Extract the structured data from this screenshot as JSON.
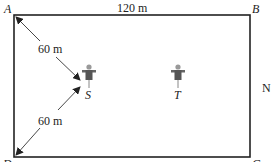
{
  "diagram": {
    "type": "field-layout",
    "corners": {
      "top_left": "A",
      "top_right": "B",
      "bottom_right": "C",
      "bottom_left": "D"
    },
    "dimensions": {
      "top_edge": "120 m"
    },
    "distances": [
      {
        "from": "A",
        "to": "S",
        "label": "60 m"
      },
      {
        "from": "D",
        "to": "S",
        "label": "60 m"
      }
    ],
    "points": [
      {
        "id": "S",
        "label": "S",
        "icon": "scarecrow-icon"
      },
      {
        "id": "T",
        "label": "T",
        "icon": "scarecrow-icon"
      }
    ],
    "side_label": "N",
    "colors": {
      "border": "#222222",
      "arrow": "#333333",
      "figure": "#555555",
      "background": "#ffffff"
    }
  }
}
